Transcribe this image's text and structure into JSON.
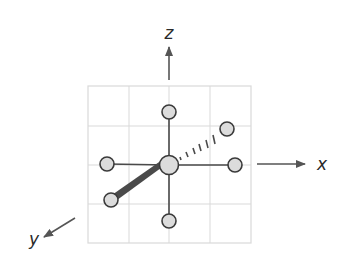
{
  "diagram": {
    "axes": {
      "z": {
        "label": "z",
        "direction": "up"
      },
      "x": {
        "label": "x",
        "direction": "right"
      },
      "y": {
        "label": "y",
        "direction": "down-left (toward viewer)"
      }
    },
    "grid": {
      "rows": 4,
      "cols": 4,
      "color": "#d9d9d9"
    },
    "atoms": {
      "central": {
        "label": "central-atom",
        "fill": "#dcdcdc"
      },
      "ligands": [
        {
          "id": "top",
          "bond": "solid"
        },
        {
          "id": "bottom",
          "bond": "solid"
        },
        {
          "id": "left",
          "bond": "solid"
        },
        {
          "id": "right",
          "bond": "solid"
        },
        {
          "id": "upper-right",
          "bond": "hashed-wedge (behind plane)"
        },
        {
          "id": "lower-left",
          "bond": "solid-wedge (toward viewer)"
        }
      ]
    },
    "colors": {
      "atom_fill": "#dcdcdc",
      "atom_stroke": "#3a3a3a",
      "bond": "#4a4a4a",
      "axis_arrow": "#555555",
      "label": "#2a2a2a"
    }
  }
}
